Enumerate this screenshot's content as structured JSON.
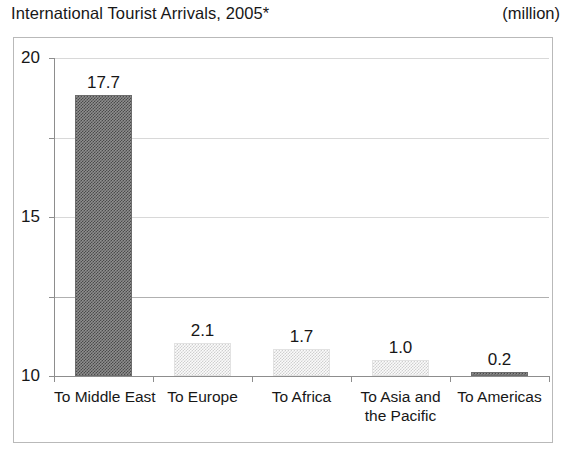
{
  "header": {
    "title": "International Tourist Arrivals, 2005*",
    "units": "(million)"
  },
  "chart_data": {
    "type": "bar",
    "title": "International Tourist Arrivals, 2005*",
    "subtitle": "(million)",
    "xlabel": "",
    "ylabel": "",
    "unit": "million",
    "ylim": [
      0,
      20
    ],
    "yticks": [
      0,
      5,
      10,
      15,
      20
    ],
    "ytick_labels": [
      "0",
      "5",
      "10",
      "15",
      "20"
    ],
    "grid": true,
    "legend": false,
    "categories": [
      "To Middle East",
      "To Europe",
      "To Africa",
      "To Asia and the Pacific",
      "To Americas"
    ],
    "category_lines": [
      [
        "To Middle East"
      ],
      [
        "To Europe"
      ],
      [
        "To Africa"
      ],
      [
        "To Asia and",
        "the Pacific"
      ],
      [
        "To Americas"
      ]
    ],
    "values": [
      17.7,
      2.1,
      1.7,
      1.0,
      0.2
    ],
    "value_labels": [
      "17.7",
      "2.1",
      "1.7",
      "1.0",
      "0.2"
    ],
    "bar_styles": [
      "dark",
      "light",
      "light",
      "light",
      "dark"
    ],
    "colors": {
      "bar_dark": "#4a4a4a",
      "bar_light": "#cfcfcf",
      "axis": "#8d8d8d",
      "grid": "#d8d8d8",
      "frame": "#b9b9b9",
      "text": "#171717"
    }
  }
}
